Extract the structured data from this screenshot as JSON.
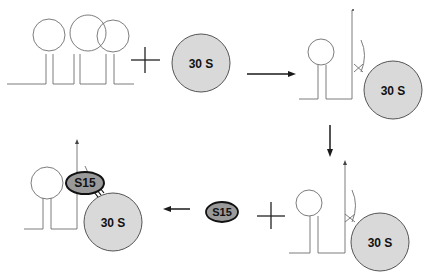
{
  "diagram": {
    "colors": {
      "line": "#6e6e6e",
      "ribosome_fill": "#d9d9d9",
      "s15_fill": "#9a9a9a",
      "arrow": "#1a1a1a"
    },
    "step1": {
      "mrna": "mRNA with three stem-loops",
      "operator": "+",
      "ribosome_label": "30 S"
    },
    "step2": {
      "arrow": "right",
      "ribosome_label": "30 S",
      "mrna": "pseudoknot mRNA bound to 30S"
    },
    "step3": {
      "arrow": "down",
      "ribosome_label": "30 S"
    },
    "step4": {
      "arrow": "left",
      "protein_label": "S15",
      "operator": "+"
    },
    "step5": {
      "protein_label": "S15",
      "ribosome_label": "30 S",
      "mrna": "S15 trapped complex"
    }
  }
}
